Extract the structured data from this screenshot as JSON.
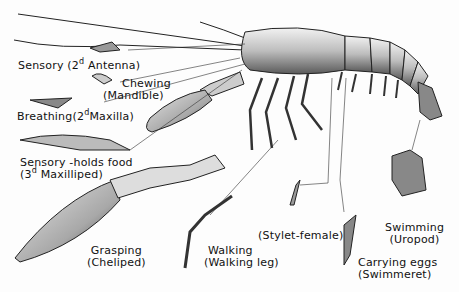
{
  "diagram": {
    "labels": [
      {
        "id": "antenna",
        "function": "Sensory",
        "part_pre": "(2",
        "sup": "d",
        "part_post": " Antenna)"
      },
      {
        "id": "mandible",
        "function": "Chewing",
        "part": "(Mandible)"
      },
      {
        "id": "maxilla",
        "function": "Breathing",
        "part_pre": "(2",
        "sup": "d",
        "part_post": "Maxilla)"
      },
      {
        "id": "maxilliped",
        "function": "Sensory -holds food",
        "part_pre": "(3",
        "sup": "d",
        "part_post": " Maxilliped)"
      },
      {
        "id": "cheliped",
        "function": "Grasping",
        "part": "(Cheliped)"
      },
      {
        "id": "walking",
        "function": "Walking",
        "part": "(Walking leg)"
      },
      {
        "id": "stylet",
        "function": "",
        "part": "(Stylet-female)"
      },
      {
        "id": "swimmeret",
        "function": "Carrying eggs",
        "part": "(Swimmeret)"
      },
      {
        "id": "uropod",
        "function": "Swimming",
        "part": "(Uropod)"
      }
    ]
  }
}
